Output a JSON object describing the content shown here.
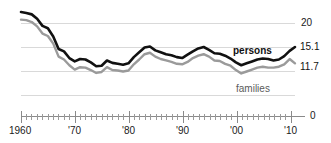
{
  "chart_data": {
    "type": "line",
    "title": "",
    "subtitle": "",
    "xlabel": "",
    "ylabel": "",
    "xlim": [
      1959,
      2010
    ],
    "ylim": [
      0,
      22.5
    ],
    "grid": true,
    "gridlines": [
      20,
      15,
      10,
      5
    ],
    "legend_position": "inline-right",
    "x": [
      1959,
      1960,
      1961,
      1962,
      1963,
      1964,
      1965,
      1966,
      1967,
      1968,
      1969,
      1970,
      1971,
      1972,
      1973,
      1974,
      1975,
      1976,
      1977,
      1978,
      1979,
      1980,
      1981,
      1982,
      1983,
      1984,
      1985,
      1986,
      1987,
      1988,
      1989,
      1990,
      1991,
      1992,
      1993,
      1994,
      1995,
      1996,
      1997,
      1998,
      1999,
      2000,
      2001,
      2002,
      2003,
      2004,
      2005,
      2006,
      2007,
      2008,
      2009,
      2010
    ],
    "series": [
      {
        "name": "persons",
        "color": "#111111",
        "values": [
          22.4,
          22.2,
          21.9,
          21.0,
          19.5,
          19.0,
          17.3,
          14.7,
          14.2,
          12.8,
          12.1,
          12.6,
          12.5,
          11.9,
          11.1,
          11.2,
          12.3,
          11.8,
          11.6,
          11.4,
          11.7,
          13.0,
          14.0,
          15.0,
          15.2,
          14.4,
          14.0,
          13.6,
          13.4,
          13.0,
          12.8,
          13.5,
          14.2,
          14.8,
          15.1,
          14.5,
          13.8,
          13.7,
          13.3,
          12.7,
          11.9,
          11.3,
          11.7,
          12.1,
          12.5,
          12.7,
          12.6,
          12.3,
          12.5,
          13.2,
          14.3,
          15.1
        ]
      },
      {
        "name": "families",
        "color": "#9a9a9a",
        "values": [
          20.8,
          20.7,
          20.3,
          19.4,
          17.9,
          17.4,
          15.8,
          13.1,
          12.5,
          11.3,
          10.4,
          10.9,
          10.8,
          10.3,
          9.7,
          9.9,
          10.9,
          10.3,
          10.2,
          10.0,
          10.2,
          11.5,
          12.5,
          13.6,
          13.9,
          13.1,
          12.6,
          12.3,
          12.0,
          11.6,
          11.5,
          12.0,
          12.8,
          13.3,
          13.6,
          13.1,
          12.3,
          12.2,
          11.6,
          11.2,
          10.3,
          9.6,
          10.0,
          10.4,
          10.8,
          11.0,
          10.8,
          10.8,
          11.0,
          11.5,
          12.6,
          11.7
        ]
      }
    ],
    "y_tick_labels": [
      "20",
      "0"
    ],
    "x_tick_labels": [
      "1960",
      "'70",
      "'80",
      "'90",
      "'00",
      "'10"
    ],
    "x_tick_years": [
      1960,
      1970,
      1980,
      1990,
      2000,
      2010
    ],
    "end_value_labels": [
      {
        "name": "persons-end-value",
        "text": "15.1",
        "series": "persons"
      },
      {
        "name": "families-end-value",
        "text": "11.7",
        "series": "families"
      }
    ],
    "inline_labels": [
      {
        "name": "persons-series-label",
        "text": "persons",
        "color": "#111111"
      },
      {
        "name": "families-series-label",
        "text": "families",
        "color": "#5a5a5a"
      }
    ],
    "axis_zero_label": "0",
    "axis_top_label": "20",
    "colors": {
      "persons": "#111111",
      "families": "#9a9a9a",
      "gridline": "#d9d9d9",
      "axis": "#8a8a8a",
      "background": "#ffffff"
    }
  }
}
